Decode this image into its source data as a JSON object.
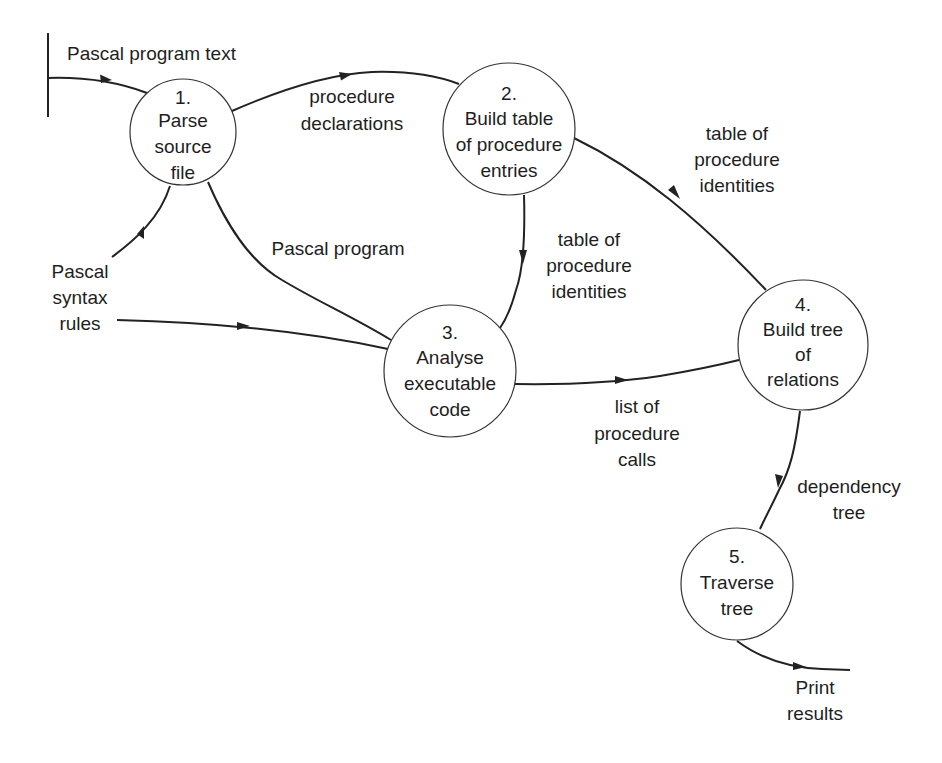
{
  "diagram": {
    "type": "data-flow-diagram",
    "colors": {
      "line": "#222222",
      "text": "#1e1e1e",
      "background": "#ffffff"
    },
    "external": {
      "source_label": "Pascal program text"
    },
    "processes": [
      {
        "id": "1",
        "number": "1.",
        "lines": [
          "Parse",
          "source",
          "file"
        ]
      },
      {
        "id": "2",
        "number": "2.",
        "lines": [
          "Build table",
          "of procedure",
          "entries"
        ]
      },
      {
        "id": "3",
        "number": "3.",
        "lines": [
          "Analyse",
          "executable",
          "code"
        ]
      },
      {
        "id": "4",
        "number": "4.",
        "lines": [
          "Build tree",
          "of",
          "relations"
        ]
      },
      {
        "id": "5",
        "number": "5.",
        "lines": [
          "Traverse",
          "tree"
        ]
      }
    ],
    "flows": [
      {
        "id": "f1",
        "from": "external",
        "to": "1",
        "lines": [
          "Pascal program text"
        ]
      },
      {
        "id": "f2",
        "from": "1",
        "to": "2",
        "lines": [
          "procedure",
          "declarations"
        ]
      },
      {
        "id": "f3",
        "from": "Pascal syntax rules",
        "to": "1",
        "lines": []
      },
      {
        "id": "f4",
        "from": "1",
        "to": "3",
        "lines": [
          "Pascal program"
        ]
      },
      {
        "id": "f5",
        "from": "Pascal syntax rules",
        "to": "3",
        "lines": []
      },
      {
        "id": "f6",
        "from": "2",
        "to": "3",
        "lines": [
          "table of",
          "procedure",
          "identities"
        ]
      },
      {
        "id": "f7",
        "from": "2",
        "to": "4",
        "lines": [
          "table of",
          "procedure",
          "identities"
        ]
      },
      {
        "id": "f8",
        "from": "3",
        "to": "4",
        "lines": [
          "list of",
          "procedure",
          "calls"
        ]
      },
      {
        "id": "f9",
        "from": "4",
        "to": "5",
        "lines": [
          "dependency",
          "tree"
        ]
      },
      {
        "id": "f10",
        "from": "5",
        "to": "Print results",
        "lines": [
          "Print",
          "results"
        ]
      }
    ],
    "terminators": {
      "syntax_rules": [
        "Pascal",
        "syntax",
        "rules"
      ],
      "print_results": [
        "Print",
        "results"
      ]
    }
  }
}
